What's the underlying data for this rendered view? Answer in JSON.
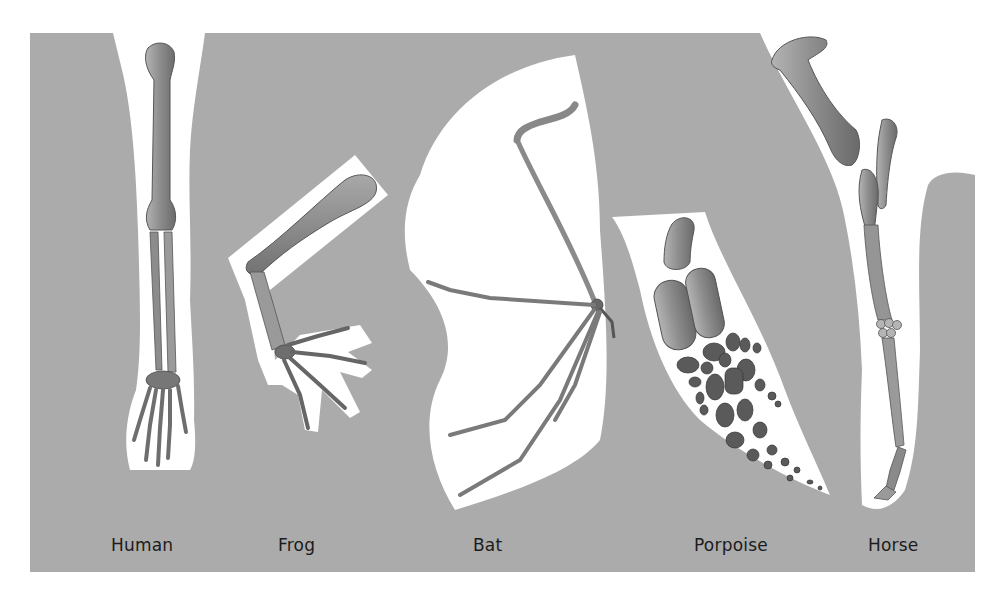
{
  "figure": {
    "type": "homologous-forelimb-comparison",
    "colors": {
      "background": "#ffffff",
      "panel": "#ababab",
      "silhouette": "#ffffff",
      "bone_light": "#9a9a9a",
      "bone_mid": "#858585",
      "bone_dark": "#5e5e5e",
      "label_text": "#1c1c1c"
    },
    "specimens": [
      {
        "id": "human",
        "label": "Human"
      },
      {
        "id": "frog",
        "label": "Frog"
      },
      {
        "id": "bat",
        "label": "Bat"
      },
      {
        "id": "porpoise",
        "label": "Porpoise"
      },
      {
        "id": "horse",
        "label": "Horse"
      }
    ]
  }
}
